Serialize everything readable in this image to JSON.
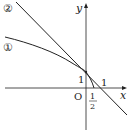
{
  "diagram": {
    "axes": {
      "x_label": "x",
      "y_label": "y",
      "origin_label": "O"
    },
    "tick_labels": {
      "y_intercept": "1",
      "x_one": "1",
      "x_half_num": "1",
      "x_half_den": "2"
    },
    "curves": [
      {
        "id": "curve-1",
        "label": "①",
        "description": "concave curve through (0,1) and (1/2,0)"
      },
      {
        "id": "line-2",
        "label": "②",
        "description": "line through (0,1) and (1,0)"
      }
    ],
    "colors": {
      "stroke": "#222222",
      "background": "#ffffff"
    }
  }
}
